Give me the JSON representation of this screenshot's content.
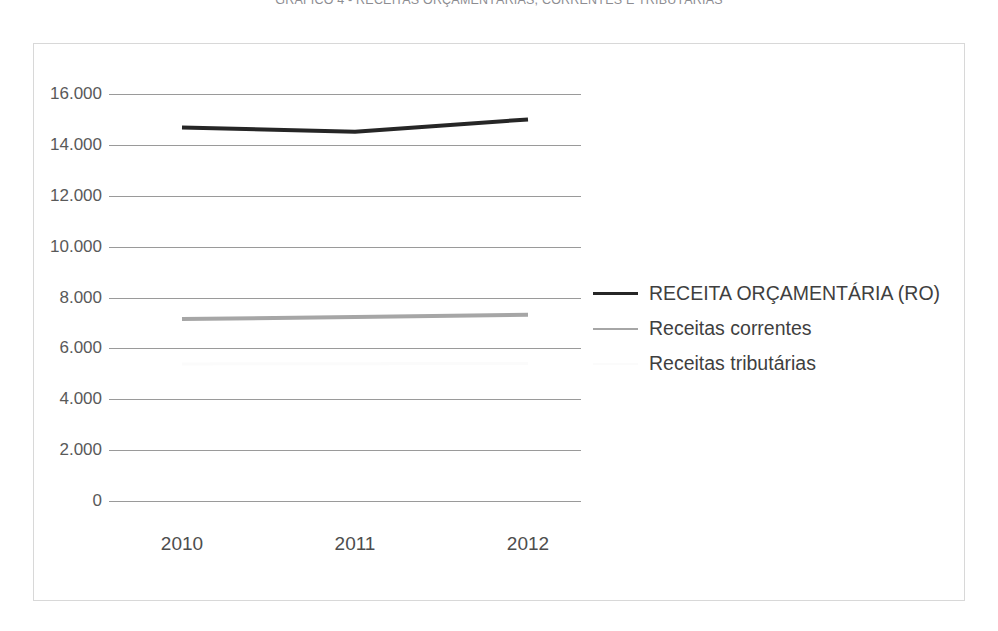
{
  "title": "GRÁFICO 4 - RECEITAS ORÇAMENTÁRIAS, CORRENTES E TRIBUTÁRIAS",
  "chart_data": {
    "type": "line",
    "title": "GRÁFICO 4 - RECEITAS ORÇAMENTÁRIAS, CORRENTES E TRIBUTÁRIAS",
    "xlabel": "",
    "ylabel": "",
    "categories": [
      "2010",
      "2011",
      "2012"
    ],
    "ylim": [
      0,
      16000
    ],
    "ytick_labels": [
      "0",
      "2.000",
      "4.000",
      "6.000",
      "8.000",
      "10.000",
      "12.000",
      "14.000",
      "16.000"
    ],
    "ytick_values": [
      0,
      2000,
      4000,
      6000,
      8000,
      10000,
      12000,
      14000,
      16000
    ],
    "grid": true,
    "grid_axis": "y",
    "legend_position": "right",
    "series": [
      {
        "name": "RECEITA ORÇAMENTÁRIA (RO)",
        "color": "#262626",
        "width": 4,
        "values": [
          14680,
          14520,
          15000
        ]
      },
      {
        "name": "Receitas correntes",
        "color": "#a6a6a6",
        "width": 4,
        "values": [
          7150,
          7230,
          7320
        ]
      },
      {
        "name": "Receitas tributárias",
        "color": "#fbfbfb",
        "width": 3,
        "values": [
          5390,
          5400,
          5410
        ]
      }
    ]
  },
  "colors": {
    "frame_border": "#d8d8d8",
    "gridline": "#9a9a9a",
    "axis_text": "#595959",
    "title_text": "#8d8d92",
    "legend_text": "#3f3f3f",
    "background": "#ffffff"
  }
}
